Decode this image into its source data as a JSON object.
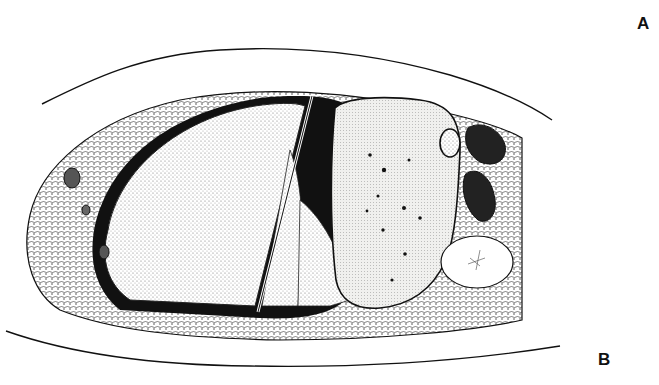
{
  "figure": {
    "type": "anatomical cross-section illustration",
    "labels": [
      {
        "id": "A",
        "text": "A",
        "position": "top-right"
      },
      {
        "id": "B",
        "text": "B",
        "position": "bottom-right"
      }
    ],
    "colors": {
      "background": "#ffffff",
      "ink": "#111111",
      "stipple_fill": "#e6e6e2"
    }
  }
}
